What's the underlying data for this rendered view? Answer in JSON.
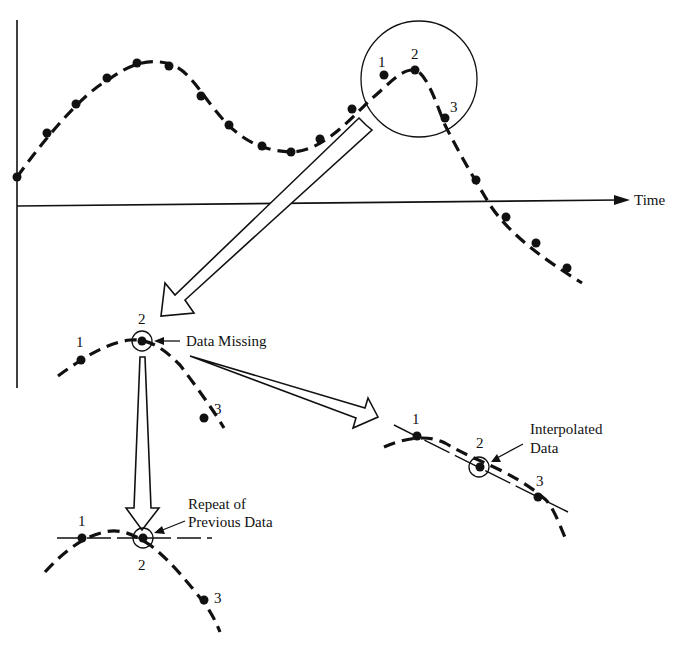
{
  "figure": {
    "axis_label_x": "Time",
    "zoom_callout": {
      "point_labels": [
        "1",
        "2",
        "3"
      ]
    },
    "missing_panel": {
      "point_labels": [
        "1",
        "2",
        "3"
      ],
      "annotation": "Data Missing"
    },
    "repeat_panel": {
      "point_labels": [
        "1",
        "2",
        "3"
      ],
      "annotation_line1": "Repeat of",
      "annotation_line2": "Previous Data"
    },
    "interpolated_panel": {
      "point_labels": [
        "1",
        "2",
        "3"
      ],
      "annotation_line1": "Interpolated",
      "annotation_line2": "Data"
    },
    "colors": {
      "ink": "#111111",
      "background": "#ffffff"
    }
  }
}
